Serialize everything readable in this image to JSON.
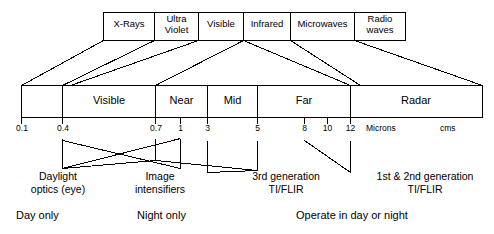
{
  "diagram": {
    "stroke_color": "#000000",
    "background_color": "#ffffff",
    "spectrum_bands": [
      {
        "label": "X-Rays",
        "line1": "X-Rays",
        "line2": ""
      },
      {
        "label": "Ultra Violet",
        "line1": "Ultra",
        "line2": "Violet"
      },
      {
        "label": "Visible",
        "line1": "Visible",
        "line2": ""
      },
      {
        "label": "Infrared",
        "line1": "Infrared",
        "line2": ""
      },
      {
        "label": "Microwaves",
        "line1": "Microwaves",
        "line2": ""
      },
      {
        "label": "Radio waves",
        "line1": "Radio",
        "line2": "waves"
      }
    ],
    "regions": [
      {
        "label": "",
        "from": "0.1",
        "to": "0.4"
      },
      {
        "label": "Visible",
        "from": "0.4",
        "to": "0.7"
      },
      {
        "label": "Near",
        "from": "0.7",
        "to": "3"
      },
      {
        "label": "Mid",
        "from": "3",
        "to": "5"
      },
      {
        "label": "Far",
        "from": "5",
        "to": "12"
      },
      {
        "label": "Radar",
        "from": "12",
        "to": ""
      }
    ],
    "scale": {
      "ticks": [
        "0.1",
        "0.4",
        "0.7",
        "1",
        "3",
        "5",
        "8",
        "10",
        "12"
      ],
      "unit_primary": "Microns",
      "unit_secondary": "cms"
    },
    "devices": [
      {
        "line1": "Daylight",
        "line2": "optics (eye)"
      },
      {
        "line1": "Image",
        "line2": "intensifiers"
      },
      {
        "line1": "3rd generation",
        "line2": "TI/FLIR"
      },
      {
        "line1": "1st & 2nd generation",
        "line2": "TI/FLIR"
      }
    ],
    "conditions": [
      {
        "label": "Day only"
      },
      {
        "label": "Night only"
      },
      {
        "label": "Operate in day or night"
      }
    ]
  }
}
